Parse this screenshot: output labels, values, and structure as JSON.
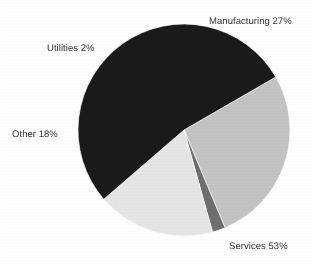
{
  "chart_data": {
    "type": "pie",
    "title": "",
    "labels": [
      "Manufacturing",
      "Services",
      "Other",
      "Utilities"
    ],
    "values": [
      27,
      53,
      18,
      2
    ],
    "unit": "%",
    "legend": "none",
    "data_labels_position": "outside",
    "slice_colors": [
      "#c4c4c4",
      "#1a1a1a",
      "#e6e6e6",
      "#6e6e6e"
    ],
    "annotations": [
      "Manufacturing 27%",
      "Services 53%",
      "Other 18%",
      "Utilities 2%"
    ],
    "slices": [
      {
        "name": "Manufacturing",
        "value": 27,
        "label": "Manufacturing 27%",
        "color": "#c4c4c4",
        "start_angle": 60,
        "end_angle": 157.2
      },
      {
        "name": "Utilities",
        "value": 2,
        "label": "Utilities 2%",
        "color": "#6e6e6e",
        "start_angle": 157.2,
        "end_angle": 164.4
      },
      {
        "name": "Other",
        "value": 18,
        "label": "Other 18%",
        "color": "#e6e6e6",
        "start_angle": 164.4,
        "end_angle": 229.2
      },
      {
        "name": "Services",
        "value": 53,
        "label": "Services 53%",
        "color": "#1a1a1a",
        "start_angle": 229.2,
        "end_angle": 420
      }
    ],
    "geometry": {
      "center_x": 184,
      "center_y": 130,
      "radius": 106
    }
  },
  "labels": {
    "manufacturing": "Manufacturing 27%",
    "utilities": "Utilities 2%",
    "other": "Other 18%",
    "services": "Services 53%"
  },
  "colors": {
    "background": "#ffffff",
    "text": "#333333",
    "manufacturing": "#c4c4c4",
    "utilities": "#6e6e6e",
    "other": "#e6e6e6",
    "services": "#1a1a1a",
    "slice_outline": "#ffffff"
  }
}
